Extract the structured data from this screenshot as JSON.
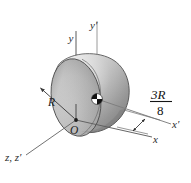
{
  "figure": {
    "type": "engineering-mechanics-diagram",
    "background_color": "#ffffff",
    "body": {
      "name": "hemisphere",
      "flat_face_fill_light": "#d2d2d2",
      "flat_face_fill_mid": "#b4b4b4",
      "dome_fill_light": "#e4e4e4",
      "dome_fill_dark": "#8f8f8f",
      "outline_color": "#4a4a4a"
    },
    "axes": [
      {
        "id": "y",
        "label": "y",
        "orientation": "vertical",
        "note": "axis through origin O"
      },
      {
        "id": "yp",
        "label": "y′",
        "orientation": "vertical",
        "note": "axis through center of mass"
      },
      {
        "id": "x",
        "label": "x",
        "orientation": "oblique-right",
        "note": "axis through origin O"
      },
      {
        "id": "xp",
        "label": "x′",
        "orientation": "oblique-right",
        "note": "axis through center of mass"
      },
      {
        "id": "zzp",
        "label": "z, z′",
        "orientation": "oblique-left-down",
        "note": "coincident z and z-prime axes"
      }
    ],
    "labels": {
      "origin": "O",
      "radius": "R",
      "centroid_marker": "center-of-mass-symbol"
    },
    "dimension": {
      "numerator": "3R",
      "denominator": "8",
      "display": "3R/8",
      "meaning": "centroid offset from flat face along x"
    },
    "caption": ""
  }
}
